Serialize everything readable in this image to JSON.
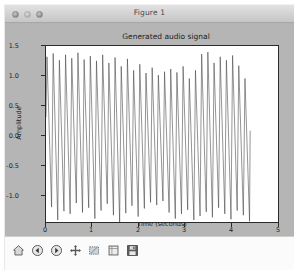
{
  "window": {
    "title": "Figure 1",
    "controls": [
      {
        "name": "close-button",
        "color": "#9a9a9a"
      },
      {
        "name": "minimize-button",
        "color": "#b4b4b4"
      },
      {
        "name": "maximize-button",
        "color": "#9a9a9a"
      }
    ],
    "background": "#b5b5b5"
  },
  "toolbar": {
    "buttons": [
      {
        "name": "home-button",
        "icon": "home-icon",
        "tooltip": "Reset original view"
      },
      {
        "name": "back-button",
        "icon": "back-arrow-icon",
        "tooltip": "Back to previous view"
      },
      {
        "name": "forward-button",
        "icon": "forward-arrow-icon",
        "tooltip": "Forward to next view"
      },
      {
        "name": "pan-button",
        "icon": "move-cross-icon",
        "tooltip": "Pan axes with left mouse, zoom with right"
      },
      {
        "name": "zoom-button",
        "icon": "zoom-rect-icon",
        "tooltip": "Zoom to rectangle"
      },
      {
        "name": "subplots-button",
        "icon": "sliders-icon",
        "tooltip": "Configure subplots"
      },
      {
        "name": "save-button",
        "icon": "floppy-save-icon",
        "tooltip": "Save the figure"
      }
    ]
  },
  "chart_data": {
    "type": "line",
    "title": "Generated audio signal",
    "xlabel": "Time (seconds)",
    "ylabel": "Amplitude",
    "xlim": [
      0,
      5
    ],
    "ylim": [
      -1.0,
      1.6
    ],
    "grid": false,
    "legend": null,
    "xticks": [
      0,
      1,
      2,
      3,
      4,
      5
    ],
    "xticklabels": [
      "0",
      "1",
      "2",
      "3",
      "4",
      "5"
    ],
    "yticks": [
      -1.0,
      -0.5,
      0.0,
      0.5,
      1.0,
      1.5
    ],
    "yticklabels": [
      "-1.0",
      "-0.5",
      "0.0",
      "0.5",
      "1.0",
      "1.5"
    ],
    "line_color": "#3a3a3a",
    "line_width": 0.6,
    "series": [
      {
        "name": "audio signal",
        "description": "Dense oscillating waveform, roughly 33 cycles spanning t=0 to t=4.4 s (~7.5 Hz apparent), sharp alternating peaks and troughs with a slowly varying envelope.",
        "x_start": 0.0,
        "x_end": 4.4,
        "cycles": 33,
        "peaks": [
          1.44,
          1.49,
          1.39,
          1.47,
          1.42,
          1.5,
          1.4,
          1.45,
          1.38,
          1.47,
          1.35,
          1.43,
          1.3,
          1.41,
          1.24,
          1.33,
          1.2,
          1.28,
          1.17,
          1.22,
          1.26,
          1.21,
          1.3,
          1.12,
          1.24,
          1.48,
          1.51,
          1.35,
          1.44,
          1.39,
          1.46,
          1.31,
          1.12
        ],
        "troughs": [
          -0.78,
          -0.97,
          -0.84,
          -0.88,
          -0.72,
          -0.86,
          -0.79,
          -0.95,
          -0.83,
          -0.73,
          -0.9,
          -1.0,
          -0.87,
          -0.76,
          -0.92,
          -0.8,
          -0.71,
          -0.75,
          -0.69,
          -0.86,
          -0.95,
          -0.88,
          -0.82,
          -0.97,
          -0.91,
          -0.85,
          -0.93,
          -0.79,
          -0.88,
          -0.96,
          -0.83,
          -0.9,
          -0.99
        ]
      }
    ]
  }
}
